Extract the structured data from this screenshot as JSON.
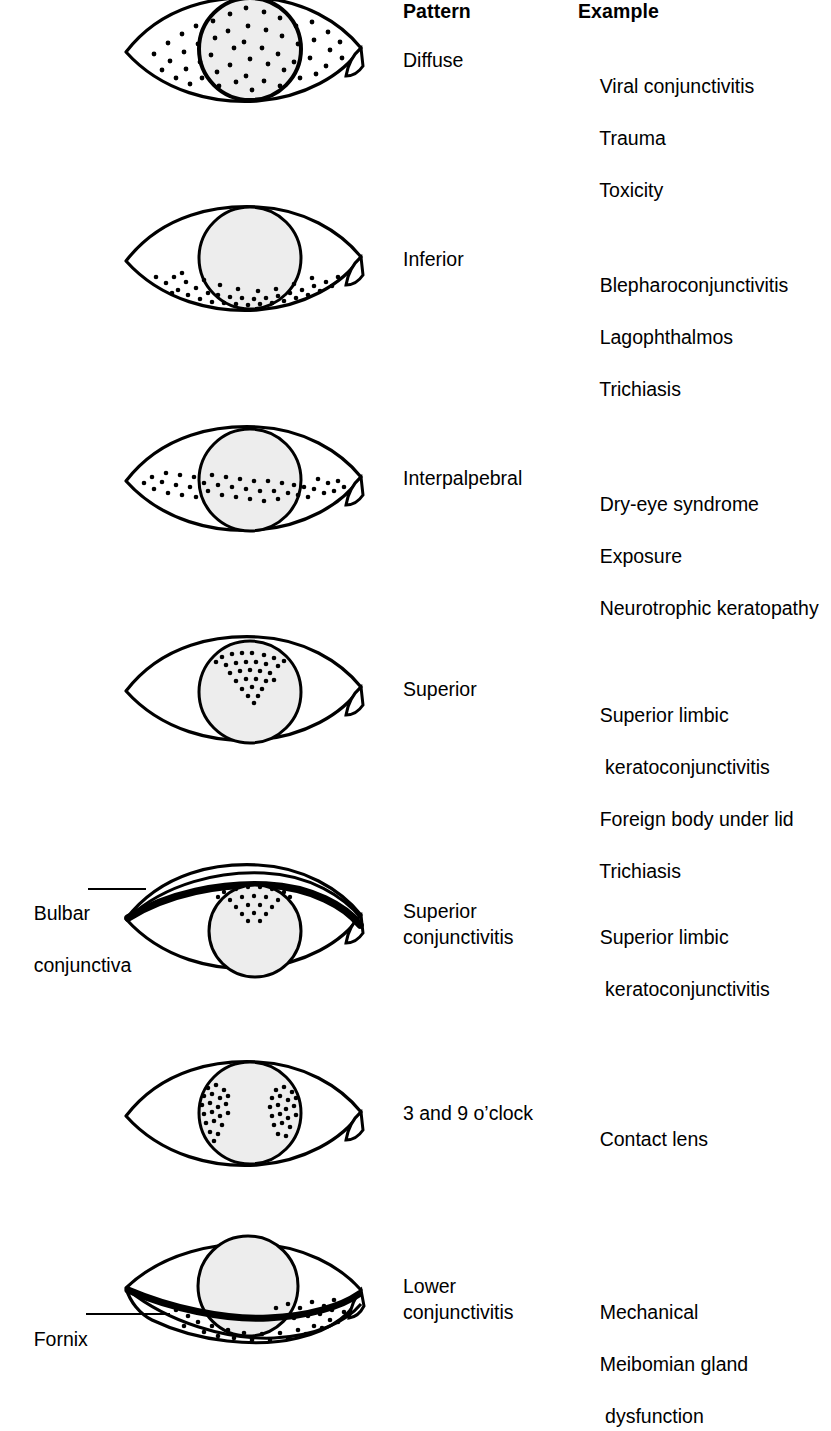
{
  "figure": {
    "title_columns": {
      "pattern": "Pattern",
      "example": "Example"
    },
    "colors": {
      "ink": "#000000",
      "cornea_fill": "#ededed",
      "background": "#ffffff"
    },
    "annotations": [
      {
        "name": "bulbar-conjunctiva",
        "line1": "Bulbar",
        "line2": "conjunctiva"
      },
      {
        "name": "fornix",
        "line1": "Fornix",
        "line2": ""
      }
    ],
    "rows": [
      {
        "id": "diffuse",
        "pattern": "Diffuse",
        "examples": [
          "Viral conjunctivitis",
          "Trauma",
          "Toxicity"
        ],
        "stain_description": "dots scattered diffusely over cornea and entire bulbar surface"
      },
      {
        "id": "inferior",
        "pattern": "Inferior",
        "examples": [
          "Blepharoconjunctivitis",
          "Lagophthalmos",
          "Trichiasis"
        ],
        "stain_description": "dots confined to the inferior third of the globe"
      },
      {
        "id": "interpalpebral",
        "pattern": "Interpalpebral",
        "examples": [
          "Dry-eye syndrome",
          "Exposure",
          "Neurotrophic keratopathy"
        ],
        "stain_description": "horizontal band of dots across the interpalpebral zone"
      },
      {
        "id": "superior",
        "pattern": "Superior",
        "examples": [
          "Superior limbic",
          " keratoconjunctivitis",
          "Foreign body under lid",
          "Trichiasis"
        ],
        "stain_description": "dots over superior cornea only"
      },
      {
        "id": "superior-conjunctivitis",
        "pattern": "Superior\nconjunctivitis",
        "examples": [
          "Superior limbic",
          " keratoconjunctivitis"
        ],
        "stain_description": "upper lid everted, dots on superior bulbar conjunctiva"
      },
      {
        "id": "three-and-nine-oclock",
        "pattern": "3 and 9 o’clock",
        "examples": [
          "Contact lens"
        ],
        "stain_description": "two dot clusters at the 3 and 9 o’clock limbal positions"
      },
      {
        "id": "lower-conjunctivitis",
        "pattern": "Lower\nconjunctivitis",
        "examples": [
          "Mechanical",
          "Meibomian gland",
          " dysfunction"
        ],
        "stain_description": "lower lid pulled down, dots in inferior fornix"
      }
    ]
  }
}
